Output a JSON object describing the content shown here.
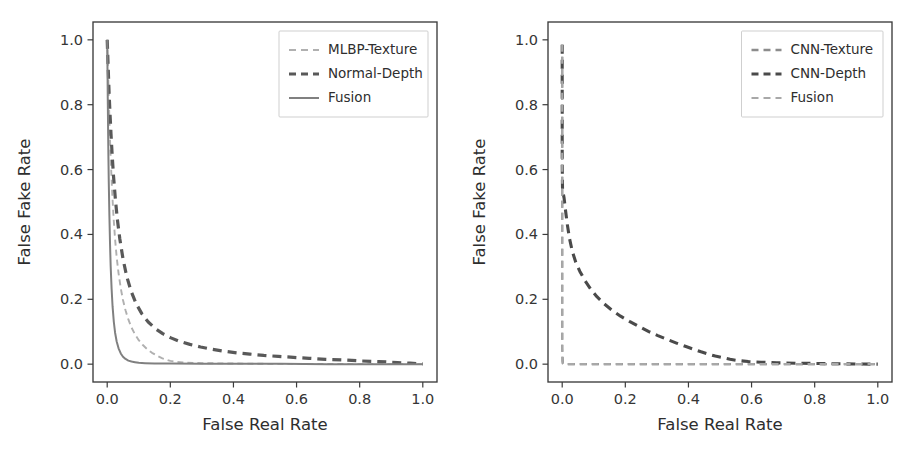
{
  "figure": {
    "background": "#ffffff",
    "width": 915,
    "height": 449,
    "panel_count": 2
  },
  "chart_data": [
    {
      "id": "left",
      "type": "line",
      "title": "",
      "xlabel": "False Real Rate",
      "ylabel": "False Fake Rate",
      "xlim": [
        -0.045,
        1.045
      ],
      "ylim": [
        -0.055,
        1.055
      ],
      "xticks": [
        0.0,
        0.2,
        0.4,
        0.6,
        0.8,
        1.0
      ],
      "yticks": [
        0.0,
        0.2,
        0.4,
        0.6,
        0.8,
        1.0
      ],
      "xticklabels": [
        "0.0",
        "0.2",
        "0.4",
        "0.6",
        "0.8",
        "1.0"
      ],
      "yticklabels": [
        "0.0",
        "0.2",
        "0.4",
        "0.6",
        "0.8",
        "1.0"
      ],
      "grid": false,
      "legend_position": "upper right",
      "series": [
        {
          "name": "MLBP-Texture",
          "color": "#b0b0b0",
          "linestyle": "dashed",
          "dasharray": "6,4",
          "linewidth": 1.9,
          "x": [
            0.0,
            0.002,
            0.004,
            0.006,
            0.008,
            0.01,
            0.013,
            0.016,
            0.02,
            0.025,
            0.03,
            0.036,
            0.043,
            0.05,
            0.058,
            0.067,
            0.077,
            0.088,
            0.1,
            0.113,
            0.127,
            0.142,
            0.158,
            0.175,
            0.2,
            0.24,
            0.3,
            0.4,
            0.5,
            0.6,
            0.7,
            0.8,
            0.9,
            1.0
          ],
          "y": [
            1.0,
            0.93,
            0.86,
            0.79,
            0.72,
            0.66,
            0.59,
            0.525,
            0.455,
            0.385,
            0.33,
            0.28,
            0.234,
            0.198,
            0.166,
            0.138,
            0.113,
            0.092,
            0.074,
            0.059,
            0.046,
            0.035,
            0.026,
            0.018,
            0.01,
            0.005,
            0.003,
            0.002,
            0.001,
            0.001,
            0.001,
            0.0,
            0.0,
            0.0
          ]
        },
        {
          "name": "Normal-Depth",
          "color": "#595959",
          "linestyle": "dashed",
          "dasharray": "9,6",
          "linewidth": 3.2,
          "x": [
            0.0,
            0.002,
            0.004,
            0.006,
            0.009,
            0.012,
            0.016,
            0.02,
            0.026,
            0.032,
            0.04,
            0.05,
            0.062,
            0.076,
            0.092,
            0.11,
            0.13,
            0.152,
            0.176,
            0.202,
            0.23,
            0.262,
            0.296,
            0.332,
            0.37,
            0.41,
            0.452,
            0.496,
            0.542,
            0.59,
            0.64,
            0.692,
            0.746,
            0.802,
            0.86,
            0.92,
            0.96,
            1.0
          ],
          "y": [
            1.0,
            0.945,
            0.89,
            0.835,
            0.77,
            0.71,
            0.64,
            0.58,
            0.508,
            0.448,
            0.386,
            0.325,
            0.27,
            0.224,
            0.186,
            0.155,
            0.13,
            0.11,
            0.094,
            0.081,
            0.07,
            0.061,
            0.053,
            0.046,
            0.04,
            0.035,
            0.031,
            0.027,
            0.024,
            0.021,
            0.018,
            0.015,
            0.013,
            0.01,
            0.008,
            0.005,
            0.003,
            0.001
          ]
        },
        {
          "name": "Fusion",
          "color": "#808080",
          "linestyle": "solid",
          "dasharray": "none",
          "linewidth": 2.0,
          "x": [
            0.0,
            0.001,
            0.002,
            0.003,
            0.004,
            0.005,
            0.007,
            0.009,
            0.011,
            0.014,
            0.017,
            0.021,
            0.025,
            0.03,
            0.036,
            0.043,
            0.05,
            0.058,
            0.067,
            0.077,
            0.088,
            0.1,
            0.12,
            0.15,
            0.2,
            0.3,
            0.4,
            0.55,
            0.7,
            0.85,
            1.0
          ],
          "y": [
            1.0,
            0.9,
            0.8,
            0.71,
            0.63,
            0.56,
            0.455,
            0.37,
            0.302,
            0.232,
            0.178,
            0.13,
            0.097,
            0.07,
            0.049,
            0.033,
            0.023,
            0.016,
            0.011,
            0.008,
            0.006,
            0.004,
            0.003,
            0.002,
            0.002,
            0.001,
            0.001,
            0.001,
            0.0,
            0.0,
            0.0
          ]
        }
      ]
    },
    {
      "id": "right",
      "type": "line",
      "title": "",
      "xlabel": "False Real Rate",
      "ylabel": "False Fake Rate",
      "xlim": [
        -0.045,
        1.045
      ],
      "ylim": [
        -0.055,
        1.055
      ],
      "xticks": [
        0.0,
        0.2,
        0.4,
        0.6,
        0.8,
        1.0
      ],
      "yticks": [
        0.0,
        0.2,
        0.4,
        0.6,
        0.8,
        1.0
      ],
      "xticklabels": [
        "0.0",
        "0.2",
        "0.4",
        "0.6",
        "0.8",
        "1.0"
      ],
      "yticklabels": [
        "0.0",
        "0.2",
        "0.4",
        "0.6",
        "0.8",
        "1.0"
      ],
      "grid": false,
      "legend_position": "upper right",
      "series": [
        {
          "name": "CNN-Texture",
          "color": "#8c8c8c",
          "linestyle": "dashed",
          "dasharray": "7,5",
          "linewidth": 2.3,
          "x": [
            0.0,
            0.0,
            0.0,
            0.0,
            0.0,
            0.0,
            0.002,
            0.01,
            0.06,
            0.15,
            0.3,
            0.5,
            0.7,
            0.85,
            1.0
          ],
          "y": [
            0.985,
            0.8,
            0.6,
            0.4,
            0.2,
            0.05,
            0.002,
            0.0,
            0.0,
            0.0,
            0.0,
            0.0,
            0.0,
            0.0,
            0.0
          ]
        },
        {
          "name": "CNN-Depth",
          "color": "#4a4a4a",
          "linestyle": "dashed",
          "dasharray": "9,6",
          "linewidth": 3.1,
          "x": [
            0.0,
            0.0,
            0.0,
            0.0,
            0.001,
            0.003,
            0.006,
            0.01,
            0.016,
            0.023,
            0.032,
            0.043,
            0.056,
            0.072,
            0.09,
            0.11,
            0.133,
            0.158,
            0.185,
            0.213,
            0.243,
            0.273,
            0.303,
            0.333,
            0.362,
            0.39,
            0.416,
            0.44,
            0.463,
            0.485,
            0.508,
            0.532,
            0.558,
            0.59,
            0.63,
            0.68,
            0.74,
            0.81,
            0.89,
            1.0
          ],
          "y": [
            0.985,
            0.87,
            0.74,
            0.62,
            0.54,
            0.528,
            0.512,
            0.478,
            0.432,
            0.388,
            0.348,
            0.314,
            0.286,
            0.258,
            0.232,
            0.208,
            0.186,
            0.166,
            0.148,
            0.132,
            0.116,
            0.101,
            0.088,
            0.076,
            0.065,
            0.055,
            0.046,
            0.038,
            0.031,
            0.025,
            0.02,
            0.015,
            0.011,
            0.008,
            0.006,
            0.004,
            0.003,
            0.002,
            0.001,
            0.0
          ]
        },
        {
          "name": "Fusion",
          "color": "#a8a8a8",
          "linestyle": "dashed",
          "dasharray": "7,5",
          "linewidth": 2.1,
          "x": [
            0.0,
            0.0,
            0.0,
            0.0,
            0.0,
            0.0,
            0.003,
            0.02,
            0.08,
            0.2,
            0.4,
            0.6,
            0.8,
            1.0
          ],
          "y": [
            0.985,
            0.78,
            0.56,
            0.34,
            0.14,
            0.01,
            0.0,
            0.0,
            0.0,
            0.0,
            0.0,
            0.0,
            0.0,
            0.0
          ]
        }
      ]
    }
  ]
}
